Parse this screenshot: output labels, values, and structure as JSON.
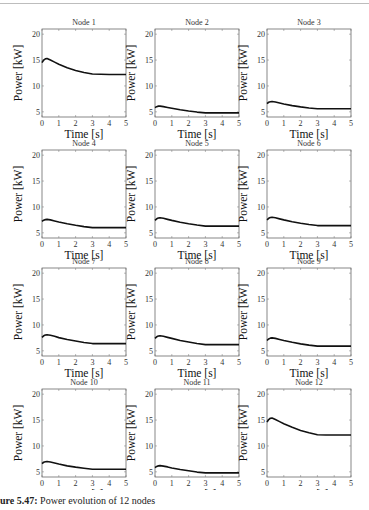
{
  "caption": {
    "label": "ure 5.47:",
    "text": "Power evolution of 12 nodes"
  },
  "axes": {
    "xlabel": "Time [s]",
    "ylabel": "Power [kW]",
    "xlim": [
      0,
      5
    ],
    "ylim": [
      4,
      21
    ],
    "xticks": [
      0,
      1,
      2,
      3,
      4,
      5
    ],
    "yticks": [
      5,
      10,
      15,
      20
    ]
  },
  "chart_data": {
    "type": "line",
    "layout": {
      "rows": 4,
      "cols": 3
    },
    "title": "",
    "xlabel": "Time [s]",
    "ylabel": "Power [kW]",
    "xlim": [
      0,
      5
    ],
    "ylim": [
      4,
      21
    ],
    "grid": false,
    "line_color": "#111111",
    "x": [
      0,
      0.1,
      0.2,
      0.3,
      0.5,
      0.75,
      1.0,
      1.5,
      2.0,
      2.5,
      3.0,
      3.5,
      4.0,
      4.5,
      5.0
    ],
    "subplots": [
      {
        "title": "Node 1",
        "values": [
          14.5,
          15.0,
          15.25,
          15.3,
          15.0,
          14.6,
          14.2,
          13.5,
          13.0,
          12.6,
          12.3,
          12.25,
          12.2,
          12.2,
          12.2
        ]
      },
      {
        "title": "Node 2",
        "values": [
          5.8,
          6.0,
          6.1,
          6.1,
          6.0,
          5.85,
          5.7,
          5.4,
          5.15,
          4.95,
          4.8,
          4.8,
          4.8,
          4.8,
          4.8
        ]
      },
      {
        "title": "Node 3",
        "values": [
          6.6,
          6.85,
          6.95,
          7.0,
          6.9,
          6.7,
          6.5,
          6.2,
          5.95,
          5.75,
          5.6,
          5.6,
          5.6,
          5.6,
          5.6
        ]
      },
      {
        "title": "Node 4",
        "values": [
          7.2,
          7.45,
          7.55,
          7.6,
          7.5,
          7.3,
          7.1,
          6.75,
          6.45,
          6.2,
          6.0,
          6.0,
          6.0,
          6.0,
          6.0
        ]
      },
      {
        "title": "Node 5",
        "values": [
          7.4,
          7.7,
          7.85,
          7.9,
          7.8,
          7.6,
          7.4,
          7.05,
          6.75,
          6.5,
          6.3,
          6.3,
          6.3,
          6.3,
          6.3
        ]
      },
      {
        "title": "Node 6",
        "values": [
          7.5,
          7.8,
          7.95,
          8.0,
          7.9,
          7.7,
          7.5,
          7.15,
          6.85,
          6.6,
          6.4,
          6.4,
          6.4,
          6.4,
          6.4
        ]
      },
      {
        "title": "Node 7",
        "values": [
          7.6,
          7.9,
          8.05,
          8.1,
          8.0,
          7.8,
          7.55,
          7.2,
          6.9,
          6.6,
          6.4,
          6.4,
          6.4,
          6.4,
          6.4
        ]
      },
      {
        "title": "Node 8",
        "values": [
          7.4,
          7.7,
          7.85,
          7.9,
          7.8,
          7.6,
          7.4,
          7.0,
          6.7,
          6.4,
          6.2,
          6.2,
          6.2,
          6.2,
          6.2
        ]
      },
      {
        "title": "Node 9",
        "values": [
          7.0,
          7.3,
          7.45,
          7.5,
          7.4,
          7.2,
          7.0,
          6.65,
          6.35,
          6.1,
          5.9,
          5.9,
          5.9,
          5.9,
          5.9
        ]
      },
      {
        "title": "Node 10",
        "values": [
          6.6,
          6.85,
          6.95,
          7.0,
          6.9,
          6.7,
          6.5,
          6.15,
          5.9,
          5.7,
          5.5,
          5.5,
          5.5,
          5.5,
          5.5
        ]
      },
      {
        "title": "Node 11",
        "values": [
          5.8,
          6.05,
          6.15,
          6.2,
          6.1,
          5.95,
          5.75,
          5.45,
          5.2,
          4.95,
          4.8,
          4.8,
          4.8,
          4.8,
          4.8
        ]
      },
      {
        "title": "Node 12",
        "values": [
          14.6,
          15.1,
          15.35,
          15.4,
          15.1,
          14.7,
          14.3,
          13.6,
          13.0,
          12.55,
          12.15,
          12.1,
          12.1,
          12.1,
          12.1
        ]
      }
    ]
  }
}
